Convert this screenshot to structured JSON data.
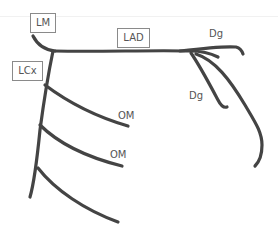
{
  "diagram": {
    "stroke_color": "#444444",
    "label_color": "#555555",
    "box_border_color": "#8a8a8a",
    "labels": {
      "lm": "LM",
      "lad": "LAD",
      "lcx": "LCx",
      "dg_top": "Dg",
      "dg_lower": "Dg",
      "om_upper": "OM",
      "om_lower": "OM"
    },
    "vessels": [
      {
        "name": "left-main",
        "label": "LM"
      },
      {
        "name": "left-anterior-descending",
        "label": "LAD"
      },
      {
        "name": "diagonal-1",
        "label": "Dg"
      },
      {
        "name": "diagonal-2",
        "label": "Dg"
      },
      {
        "name": "lad-distal",
        "label": ""
      },
      {
        "name": "left-circumflex",
        "label": "LCx"
      },
      {
        "name": "obtuse-marginal-1",
        "label": "OM"
      },
      {
        "name": "obtuse-marginal-2",
        "label": "OM"
      },
      {
        "name": "obtuse-marginal-3",
        "label": ""
      }
    ]
  }
}
